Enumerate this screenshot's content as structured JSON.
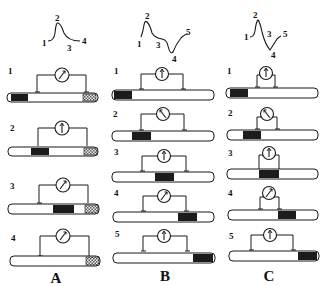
{
  "colors": {
    "ink": "#1a1a1a",
    "depolarized": "#1c1c1c",
    "crushed": "#888888",
    "tube_fill": "#ffffff"
  },
  "panels": [
    {
      "id": "A",
      "label": "A",
      "waveform": {
        "type": "monophasic",
        "points": [
          "1",
          "2",
          "3",
          "4"
        ]
      },
      "rows": [
        {
          "label": "1",
          "meter": "deflect-right",
          "dark_region": "left-end",
          "crushed_end": true
        },
        {
          "label": "2",
          "meter": "up",
          "dark_region": "under-left-electrode",
          "crushed_end": true
        },
        {
          "label": "3",
          "meter": "deflect-right",
          "dark_region": "middle",
          "crushed_end": true
        },
        {
          "label": "4",
          "meter": "deflect-right",
          "dark_region": "none",
          "crushed_end": true
        }
      ]
    },
    {
      "id": "B",
      "label": "B",
      "waveform": {
        "type": "biphasic",
        "points": [
          "1",
          "2",
          "3",
          "4",
          "5"
        ]
      },
      "rows": [
        {
          "label": "1",
          "meter": "up",
          "dark_region": "left-end"
        },
        {
          "label": "2",
          "meter": "deflect-left",
          "dark_region": "under-left-electrode"
        },
        {
          "label": "3",
          "meter": "up",
          "dark_region": "middle"
        },
        {
          "label": "4",
          "meter": "deflect-right",
          "dark_region": "under-right-electrode"
        },
        {
          "label": "5",
          "meter": "up",
          "dark_region": "right-end"
        }
      ]
    },
    {
      "id": "C",
      "label": "C",
      "waveform": {
        "type": "biphasic-close",
        "points": [
          "1",
          "2",
          "3",
          "4",
          "5"
        ]
      },
      "rows": [
        {
          "label": "1",
          "meter": "up",
          "dark_region": "left-end"
        },
        {
          "label": "2",
          "meter": "deflect-left",
          "dark_region": "under-left-electrode"
        },
        {
          "label": "3",
          "meter": "up",
          "dark_region": "between-electrodes"
        },
        {
          "label": "4",
          "meter": "deflect-right",
          "dark_region": "under-right-electrode"
        },
        {
          "label": "5",
          "meter": "up",
          "dark_region": "right-end"
        }
      ]
    }
  ]
}
